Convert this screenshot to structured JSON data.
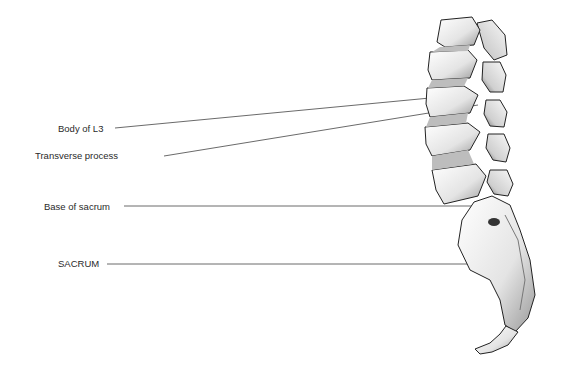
{
  "figure": {
    "labels": [
      {
        "id": "body-of-l3",
        "text": "Body of L3"
      },
      {
        "id": "transverse-process",
        "text": "Transverse process"
      },
      {
        "id": "base-of-sacrum",
        "text": "Base of sacrum"
      },
      {
        "id": "sacrum",
        "text": "SACRUM"
      }
    ]
  }
}
